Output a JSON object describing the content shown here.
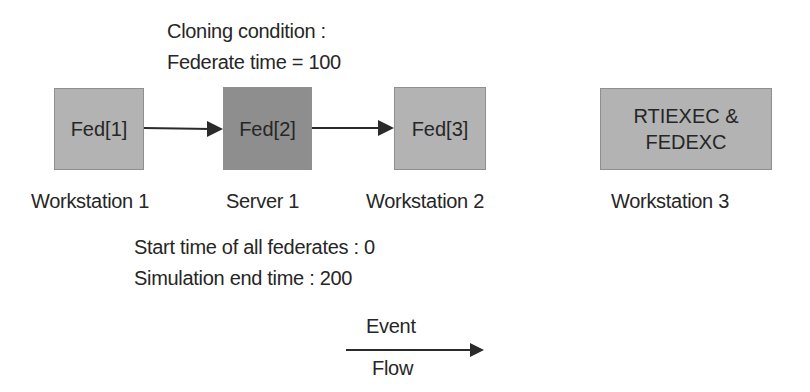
{
  "cloning_condition": {
    "line1": "Cloning condition  :",
    "line2": "Federate time  = 100"
  },
  "nodes": [
    {
      "label": "Fed[1]",
      "host": "Workstation 1",
      "fill": "#b3b3b3"
    },
    {
      "label": "Fed[2]",
      "host": "Server 1",
      "fill": "#8e8e8e"
    },
    {
      "label": "Fed[3]",
      "host": "Workstation 2",
      "fill": "#b3b3b3"
    },
    {
      "label_line1": "RTIEXEC &",
      "label_line2": "FEDEXC",
      "host": "Workstation 3",
      "fill": "#b3b3b3"
    }
  ],
  "edges": [
    {
      "from": "Fed[1]",
      "to": "Fed[2]"
    },
    {
      "from": "Fed[2]",
      "to": "Fed[3]"
    }
  ],
  "simulation": {
    "start_time": "Start time of all federates : 0",
    "end_time": "Simulation end time : 200"
  },
  "legend": {
    "top": "Event",
    "bottom": "Flow"
  }
}
